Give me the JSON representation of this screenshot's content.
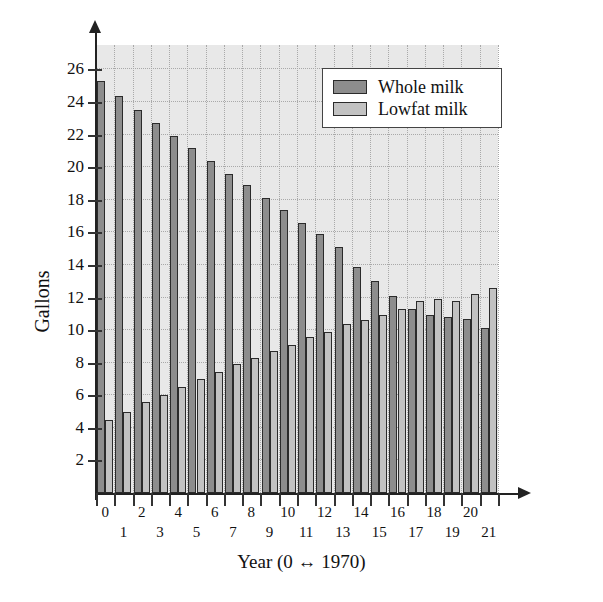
{
  "chart_data": {
    "type": "bar",
    "title": "",
    "xlabel": "Year (0 ↔ 1970)",
    "ylabel": "Gallons",
    "grid": true,
    "legend_position": "top-right",
    "xlim": [
      -0.5,
      21.5
    ],
    "ylim": [
      0,
      27.5
    ],
    "yticks": [
      2,
      4,
      6,
      8,
      10,
      12,
      14,
      16,
      18,
      20,
      22,
      24,
      26
    ],
    "categories": [
      "0",
      "1",
      "2",
      "3",
      "4",
      "5",
      "6",
      "7",
      "8",
      "9",
      "10",
      "11",
      "12",
      "13",
      "14",
      "15",
      "16",
      "17",
      "18",
      "19",
      "20",
      "21"
    ],
    "series": [
      {
        "name": "Whole milk",
        "color": "#8d8d8d",
        "values": [
          25.3,
          24.4,
          23.5,
          22.7,
          21.9,
          21.2,
          20.4,
          19.6,
          18.9,
          18.1,
          17.4,
          16.6,
          15.9,
          15.1,
          13.9,
          13.0,
          12.1,
          11.3,
          10.9,
          10.8,
          10.7,
          10.1
        ]
      },
      {
        "name": "Lowfat milk",
        "color": "#c2c2c2",
        "values": [
          4.5,
          5.0,
          5.6,
          6.0,
          6.5,
          7.0,
          7.4,
          7.9,
          8.3,
          8.7,
          9.1,
          9.6,
          9.9,
          10.4,
          10.6,
          10.9,
          11.3,
          11.8,
          11.9,
          11.8,
          12.2,
          12.6
        ]
      }
    ]
  },
  "legend": {
    "items": [
      {
        "label": "Whole milk",
        "color": "#8d8d8d"
      },
      {
        "label": "Lowfat milk",
        "color": "#c2c2c2"
      }
    ]
  },
  "axes": {
    "y_title": "Gallons",
    "x_title": "Year (0 ↔ 1970)"
  }
}
